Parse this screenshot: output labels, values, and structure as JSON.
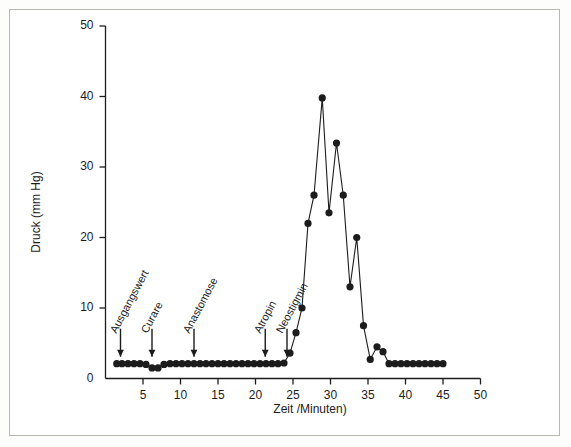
{
  "figure": {
    "background": "#ffffff",
    "border_color": "#b9b7b2",
    "ink_color": "#1c1c1c"
  },
  "chart_data": {
    "type": "line",
    "title": "",
    "xlabel": "Zeit /Minuten)",
    "ylabel": "Druck (mm Hg)",
    "xlim": [
      0,
      50
    ],
    "ylim": [
      0,
      50
    ],
    "xticks": [
      0,
      5,
      10,
      15,
      20,
      25,
      30,
      35,
      40,
      45,
      50
    ],
    "yticks": [
      0,
      10,
      20,
      30,
      40,
      50
    ],
    "grid": false,
    "legend": "none",
    "marker": "filled-circle",
    "series": [
      {
        "name": "Druck",
        "x": [
          1.5,
          2.2,
          3.0,
          3.8,
          4.6,
          5.4,
          6.2,
          7.0,
          7.8,
          8.6,
          9.4,
          10.2,
          11.0,
          11.8,
          12.6,
          13.4,
          14.2,
          15.0,
          15.8,
          16.6,
          17.4,
          18.2,
          19.0,
          19.8,
          20.6,
          21.4,
          22.2,
          23.0,
          23.8,
          24.6,
          25.4,
          26.2,
          27.0,
          27.8,
          28.9,
          29.8,
          30.8,
          31.7,
          32.6,
          33.5,
          34.4,
          35.3,
          36.2,
          37.0,
          37.8,
          38.6,
          39.4,
          40.2,
          41.0,
          41.8,
          42.6,
          43.4,
          44.2,
          45.0
        ],
        "y": [
          2.1,
          2.1,
          2.1,
          2.1,
          2.1,
          2.0,
          1.5,
          1.5,
          2.0,
          2.1,
          2.1,
          2.1,
          2.1,
          2.1,
          2.1,
          2.1,
          2.1,
          2.1,
          2.1,
          2.1,
          2.1,
          2.1,
          2.1,
          2.1,
          2.1,
          2.1,
          2.1,
          2.1,
          2.2,
          3.6,
          6.5,
          10.0,
          22.0,
          26.0,
          39.8,
          23.5,
          33.4,
          26.0,
          13.0,
          20.0,
          7.5,
          2.7,
          4.5,
          3.8,
          2.1,
          2.1,
          2.1,
          2.1,
          2.1,
          2.1,
          2.1,
          2.1,
          2.1,
          2.1
        ]
      }
    ],
    "annotations": [
      {
        "label": "Ausgangswert",
        "x": 2.0,
        "arrow": true
      },
      {
        "label": "Curare",
        "x": 6.2,
        "arrow": true
      },
      {
        "label": "Anastomose",
        "x": 11.8,
        "arrow": true
      },
      {
        "label": "Atropin",
        "x": 21.3,
        "arrow": true
      },
      {
        "label": "Neostigmin",
        "x": 24.2,
        "arrow": true
      }
    ]
  }
}
